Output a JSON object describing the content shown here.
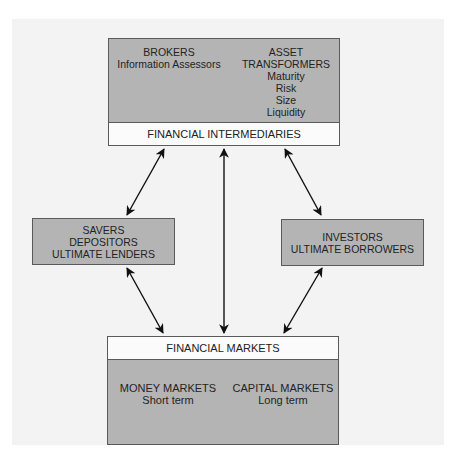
{
  "intermediaries": {
    "label": "FINANCIAL INTERMEDIARIES",
    "brokers": {
      "title": "BROKERS",
      "subtitle": "Information Assessors"
    },
    "asset_transformers": {
      "title_lines": [
        "ASSET",
        "TRANSFORMERS"
      ],
      "items": [
        "Maturity",
        "Risk",
        "Size",
        "Liquidity"
      ]
    }
  },
  "savers": {
    "lines": [
      "SAVERS",
      "DEPOSITORS",
      "ULTIMATE LENDERS"
    ]
  },
  "investors": {
    "lines": [
      "INVESTORS",
      "ULTIMATE BORROWERS"
    ]
  },
  "markets": {
    "label": "FINANCIAL MARKETS",
    "money": {
      "title": "MONEY MARKETS",
      "subtitle": "Short term"
    },
    "capital": {
      "title": "CAPITAL MARKETS",
      "subtitle": "Long term"
    }
  },
  "colors": {
    "box_fill": "#b4b4b4",
    "label_fill": "#fbfbfb",
    "border": "#5a5a5a",
    "arrow": "#111111",
    "page": "#f3f3f3"
  }
}
